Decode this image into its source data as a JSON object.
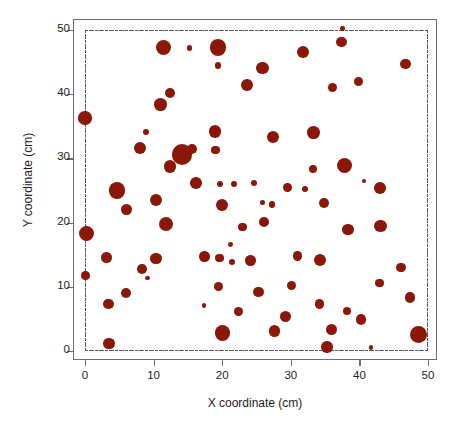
{
  "chart_data": {
    "type": "scatter",
    "title": "",
    "xlabel": "X coordinate (cm)",
    "ylabel": "Y coordinate (cm)",
    "xlim": [
      -1.8,
      51.7
    ],
    "ylim": [
      -2.5,
      51.8
    ],
    "xticks": [
      0,
      10,
      20,
      30,
      40,
      50
    ],
    "yticks": [
      0,
      10,
      20,
      30,
      40,
      50
    ],
    "xtick_labels": [
      "0",
      "10",
      "20",
      "30",
      "40",
      "50"
    ],
    "ytick_labels": [
      "0",
      "10",
      "20",
      "30",
      "40",
      "50"
    ],
    "grid": false,
    "legend": null,
    "marker_color": "#8a1708",
    "marker_shape": "circle",
    "size_encoding": "marker area varies with a third variable (e.g. plant size)",
    "annotations": [
      {
        "name": "study-area-boundary",
        "kind": "dash-dot rectangle",
        "x0": 0,
        "y0": 0,
        "x1": 50,
        "y1": 50,
        "color": "#55585e"
      }
    ],
    "points": [
      {
        "x": 11.4,
        "y": 47.2,
        "r": 7.5
      },
      {
        "x": 15.2,
        "y": 47.2,
        "r": 2.6
      },
      {
        "x": 19.4,
        "y": 47.3,
        "r": 8.2
      },
      {
        "x": 19.4,
        "y": 44.5,
        "r": 3.3
      },
      {
        "x": 37.5,
        "y": 50.2,
        "r": 2.3
      },
      {
        "x": 37.4,
        "y": 48.1,
        "r": 5.3
      },
      {
        "x": 31.8,
        "y": 46.6,
        "r": 6.2
      },
      {
        "x": 46.7,
        "y": 44.7,
        "r": 5.4
      },
      {
        "x": 25.9,
        "y": 44.1,
        "r": 6.3
      },
      {
        "x": 23.6,
        "y": 41.4,
        "r": 5.9
      },
      {
        "x": 12.4,
        "y": 40.2,
        "r": 5.0
      },
      {
        "x": 39.9,
        "y": 42.0,
        "r": 4.6
      },
      {
        "x": 11.0,
        "y": 38.4,
        "r": 6.3
      },
      {
        "x": 36.1,
        "y": 41.0,
        "r": 4.6
      },
      {
        "x": 0.0,
        "y": 36.3,
        "r": 6.6
      },
      {
        "x": 8.9,
        "y": 34.1,
        "r": 3.2
      },
      {
        "x": 19.0,
        "y": 34.2,
        "r": 6.1
      },
      {
        "x": 33.3,
        "y": 34.0,
        "r": 6.4
      },
      {
        "x": 27.4,
        "y": 33.3,
        "r": 6.2
      },
      {
        "x": 19.0,
        "y": 31.3,
        "r": 4.4
      },
      {
        "x": 8.0,
        "y": 31.6,
        "r": 6.0
      },
      {
        "x": 15.6,
        "y": 31.5,
        "r": 5.1
      },
      {
        "x": 14.1,
        "y": 30.6,
        "r": 10.2
      },
      {
        "x": 12.4,
        "y": 28.7,
        "r": 6.3
      },
      {
        "x": 33.3,
        "y": 28.3,
        "r": 4.0
      },
      {
        "x": 37.9,
        "y": 28.9,
        "r": 7.5
      },
      {
        "x": 16.2,
        "y": 26.2,
        "r": 5.8
      },
      {
        "x": 19.7,
        "y": 26.0,
        "r": 3.1
      },
      {
        "x": 21.7,
        "y": 26.0,
        "r": 3.2
      },
      {
        "x": 24.7,
        "y": 26.1,
        "r": 3.0
      },
      {
        "x": 4.7,
        "y": 25.0,
        "r": 8.1
      },
      {
        "x": 29.5,
        "y": 25.5,
        "r": 4.4
      },
      {
        "x": 32.1,
        "y": 25.3,
        "r": 3.0
      },
      {
        "x": 43.0,
        "y": 25.4,
        "r": 5.8
      },
      {
        "x": 40.6,
        "y": 26.5,
        "r": 2.0
      },
      {
        "x": 10.4,
        "y": 23.5,
        "r": 6.1
      },
      {
        "x": 6.0,
        "y": 22.1,
        "r": 5.4
      },
      {
        "x": 20.0,
        "y": 22.7,
        "r": 5.9
      },
      {
        "x": 25.9,
        "y": 23.1,
        "r": 2.3
      },
      {
        "x": 27.3,
        "y": 22.8,
        "r": 3.2
      },
      {
        "x": 34.8,
        "y": 23.1,
        "r": 4.9
      },
      {
        "x": 11.8,
        "y": 19.8,
        "r": 7.0
      },
      {
        "x": 0.2,
        "y": 18.3,
        "r": 7.7
      },
      {
        "x": 38.3,
        "y": 18.9,
        "r": 5.8
      },
      {
        "x": 43.1,
        "y": 19.5,
        "r": 6.2
      },
      {
        "x": 23.0,
        "y": 19.3,
        "r": 4.3
      },
      {
        "x": 26.1,
        "y": 20.1,
        "r": 5.1
      },
      {
        "x": 21.2,
        "y": 16.6,
        "r": 2.4
      },
      {
        "x": 3.1,
        "y": 14.6,
        "r": 5.3
      },
      {
        "x": 10.4,
        "y": 14.4,
        "r": 5.9
      },
      {
        "x": 17.4,
        "y": 14.7,
        "r": 5.3
      },
      {
        "x": 19.6,
        "y": 14.5,
        "r": 4.3
      },
      {
        "x": 21.4,
        "y": 13.9,
        "r": 3.0
      },
      {
        "x": 24.1,
        "y": 14.1,
        "r": 5.2
      },
      {
        "x": 31.0,
        "y": 14.8,
        "r": 4.7
      },
      {
        "x": 34.3,
        "y": 14.1,
        "r": 6.0
      },
      {
        "x": 8.3,
        "y": 12.8,
        "r": 4.9
      },
      {
        "x": 46.1,
        "y": 13.0,
        "r": 4.8
      },
      {
        "x": 9.1,
        "y": 11.4,
        "r": 2.2
      },
      {
        "x": 0.1,
        "y": 11.8,
        "r": 4.3
      },
      {
        "x": 19.5,
        "y": 10.1,
        "r": 4.6
      },
      {
        "x": 30.1,
        "y": 10.2,
        "r": 4.5
      },
      {
        "x": 42.9,
        "y": 10.6,
        "r": 4.4
      },
      {
        "x": 6.0,
        "y": 9.0,
        "r": 5.0
      },
      {
        "x": 25.3,
        "y": 9.2,
        "r": 5.2
      },
      {
        "x": 3.4,
        "y": 7.3,
        "r": 5.2
      },
      {
        "x": 17.4,
        "y": 7.1,
        "r": 2.1
      },
      {
        "x": 34.2,
        "y": 7.3,
        "r": 4.7
      },
      {
        "x": 47.4,
        "y": 8.3,
        "r": 5.3
      },
      {
        "x": 22.4,
        "y": 6.1,
        "r": 4.6
      },
      {
        "x": 29.2,
        "y": 5.4,
        "r": 5.5
      },
      {
        "x": 38.2,
        "y": 6.2,
        "r": 4.0
      },
      {
        "x": 40.2,
        "y": 4.9,
        "r": 5.2
      },
      {
        "x": 27.6,
        "y": 3.1,
        "r": 5.6
      },
      {
        "x": 35.9,
        "y": 3.3,
        "r": 5.5
      },
      {
        "x": 20.0,
        "y": 2.8,
        "r": 7.6
      },
      {
        "x": 48.6,
        "y": 2.6,
        "r": 8.5
      },
      {
        "x": 3.5,
        "y": 1.2,
        "r": 5.7
      },
      {
        "x": 35.3,
        "y": 0.6,
        "r": 5.7
      },
      {
        "x": 41.7,
        "y": 0.5,
        "r": 2.4
      }
    ]
  }
}
